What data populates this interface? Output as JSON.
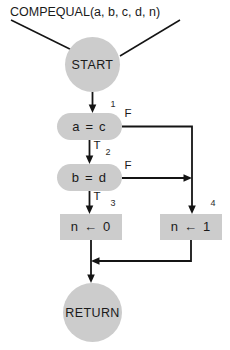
{
  "diagram": {
    "title": "COMPEQUAL(a, b, c, d, n)",
    "nodes": {
      "start": {
        "label": "START",
        "shape": "circle"
      },
      "decision1": {
        "label": "a  =  c",
        "shape": "rounded",
        "step": "1"
      },
      "decision2": {
        "label": "b  =  d",
        "shape": "rounded",
        "step": "2"
      },
      "process_left": {
        "label": "n  ←  0",
        "shape": "rectangle",
        "step": "3"
      },
      "process_right": {
        "label": "n  ←  1",
        "shape": "rectangle",
        "step": "4"
      },
      "end": {
        "label": "RETURN",
        "shape": "circle"
      }
    },
    "branch_labels": {
      "d1_false": "F",
      "d1_true": "T",
      "d2_false": "F",
      "d2_true": "T"
    },
    "colors": {
      "shape_fill": "#cccccc",
      "line": "#141414",
      "text": "#1a1a1a",
      "background": "#ffffff"
    }
  }
}
